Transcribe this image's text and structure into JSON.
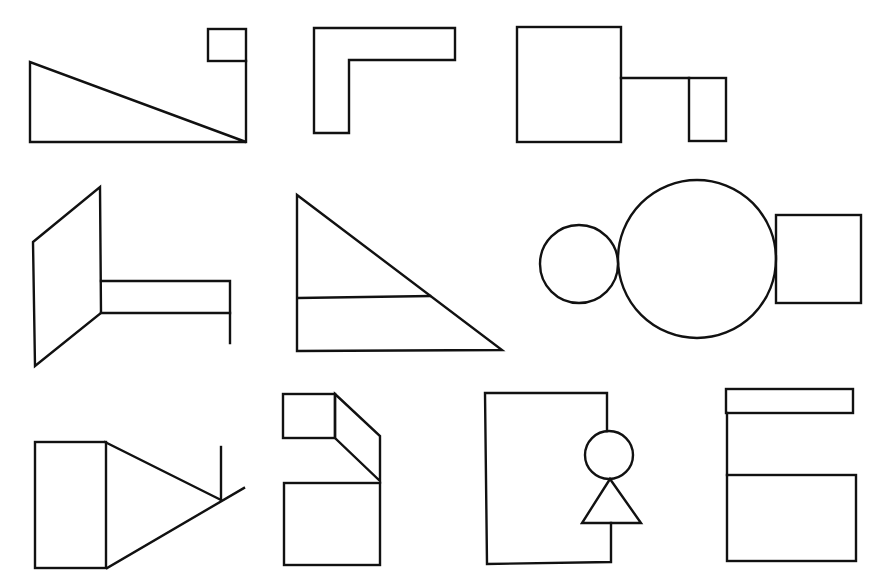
{
  "page": {
    "width": 881,
    "height": 582,
    "background": "#ffffff",
    "stroke_color": "#111111"
  },
  "header": {
    "cropped_text_fragments": [
      {
        "text": "· · ·  ·····",
        "x": 205
      },
      {
        "text": "· · · · · · · · · · ·",
        "x": 405
      }
    ]
  },
  "figures": [
    {
      "id": "fig-1",
      "description": "right triangle with small square on vertical post"
    },
    {
      "id": "fig-2",
      "description": "L-shaped outline"
    },
    {
      "id": "fig-3",
      "description": "large square connected by line to small rectangle"
    },
    {
      "id": "fig-4",
      "description": "parallelogram with horizontal bar and descending leg"
    },
    {
      "id": "fig-5",
      "description": "right triangle with horizontal divider line"
    },
    {
      "id": "fig-6",
      "description": "small circle, large circle and square in a row"
    },
    {
      "id": "fig-7",
      "description": "rectangle with triangle and intersecting lines"
    },
    {
      "id": "fig-8",
      "description": "small rectangle, slanted connector and square"
    },
    {
      "id": "fig-9",
      "description": "open rectangle with circle and triangle on right edge"
    },
    {
      "id": "fig-10",
      "description": "thin bar on top, vertical line, rectangle below"
    }
  ]
}
